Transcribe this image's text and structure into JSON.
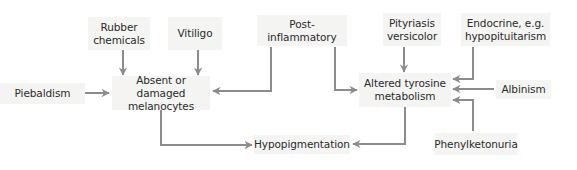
{
  "diagram": {
    "type": "flowchart",
    "colors": {
      "arrow": "#8c8c8c",
      "box_fill": "#f4f4f3",
      "text": "#2b2b2b"
    },
    "nodes": {
      "rubber": {
        "label": "Rubber\nchemicals"
      },
      "vitiligo": {
        "label": "Vitiligo"
      },
      "postinflam": {
        "label": "Post-inflammatory"
      },
      "pityriasis": {
        "label": "Pityriasis\nversicolor"
      },
      "endocrine": {
        "label": "Endocrine, e.g.\nhypopituitarism"
      },
      "piebaldism": {
        "label": "Piebaldism"
      },
      "melanocytes": {
        "label": "Absent or damaged\nmelanocytes"
      },
      "tyrosine": {
        "label": "Altered tyrosine\nmetabolism"
      },
      "albinism": {
        "label": "Albinism"
      },
      "hypopigmentation": {
        "label": "Hypopigmentation"
      },
      "pku": {
        "label": "Phenylketonuria"
      }
    },
    "edges": [
      {
        "from": "Rubber chemicals",
        "to": "Absent or damaged melanocytes"
      },
      {
        "from": "Vitiligo",
        "to": "Absent or damaged melanocytes"
      },
      {
        "from": "Piebaldism",
        "to": "Absent or damaged melanocytes"
      },
      {
        "from": "Post-inflammatory",
        "to": "Absent or damaged melanocytes"
      },
      {
        "from": "Post-inflammatory",
        "to": "Altered tyrosine metabolism"
      },
      {
        "from": "Pityriasis versicolor",
        "to": "Altered tyrosine metabolism"
      },
      {
        "from": "Endocrine, e.g. hypopituitarism",
        "to": "Altered tyrosine metabolism"
      },
      {
        "from": "Albinism",
        "to": "Altered tyrosine metabolism"
      },
      {
        "from": "Phenylketonuria",
        "to": "Altered tyrosine metabolism"
      },
      {
        "from": "Absent or damaged melanocytes",
        "to": "Hypopigmentation"
      },
      {
        "from": "Altered tyrosine metabolism",
        "to": "Hypopigmentation"
      }
    ]
  }
}
